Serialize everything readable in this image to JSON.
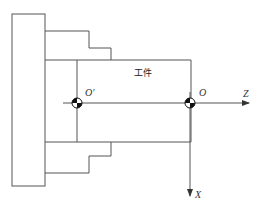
{
  "diagram": {
    "title": "",
    "workpiece_label": "工件",
    "labels": {
      "origin_chuck": "O′",
      "origin_workpiece": "O",
      "axis_z": "Z",
      "axis_x": "X"
    },
    "colors": {
      "line": "#555555",
      "symbol": "#111111",
      "background": "#ffffff"
    }
  }
}
